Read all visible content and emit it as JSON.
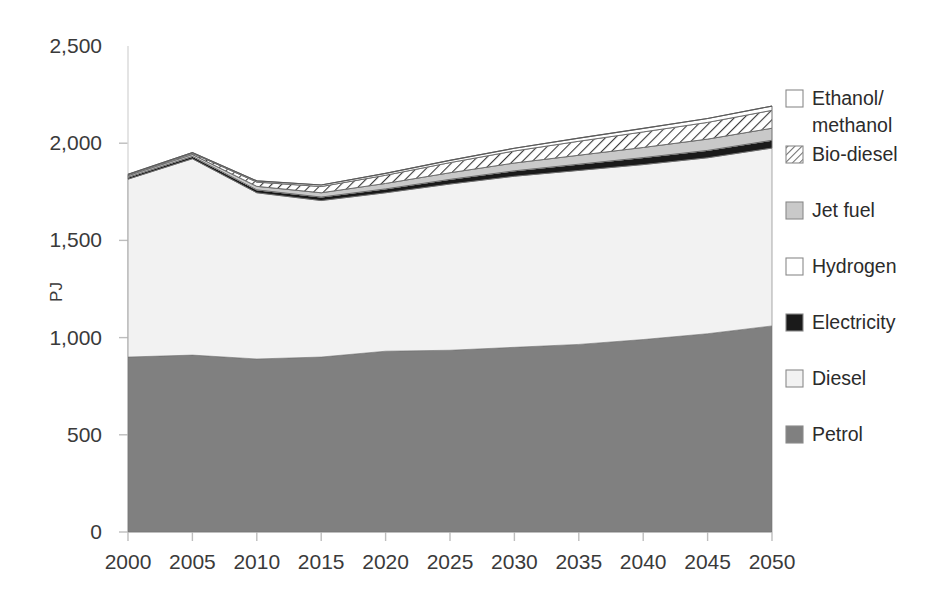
{
  "chart_data": {
    "type": "area",
    "title": "",
    "xlabel": "",
    "ylabel": "PJ",
    "x": [
      2000,
      2005,
      2010,
      2015,
      2020,
      2025,
      2030,
      2035,
      2040,
      2045,
      2050
    ],
    "xtick_labels": [
      "2000",
      "2005",
      "2010",
      "2015",
      "2020",
      "2025",
      "2030",
      "2035",
      "2040",
      "2045",
      "2050"
    ],
    "ytick_labels": [
      "0",
      "500",
      "1,000",
      "1,500",
      "2,000",
      "2,500"
    ],
    "yticks": [
      0,
      500,
      1000,
      1500,
      2000,
      2500
    ],
    "ylim": [
      0,
      2500
    ],
    "xlim": [
      2000,
      2050
    ],
    "grid": false,
    "stacked": true,
    "legend_position": "right",
    "stack_order_bottom_to_top": [
      "Petrol",
      "Diesel",
      "Electricity",
      "Hydrogen",
      "Jet fuel",
      "Bio-diesel",
      "Ethanol/methanol"
    ],
    "series": [
      {
        "name": "Petrol",
        "swatch": "#808080",
        "pattern": "solid",
        "values": [
          900,
          910,
          890,
          900,
          930,
          935,
          950,
          965,
          990,
          1020,
          1060
        ]
      },
      {
        "name": "Diesel",
        "swatch": "#f2f2f2",
        "pattern": "solid",
        "values": [
          915,
          1010,
          855,
          805,
          815,
          855,
          880,
          895,
          900,
          905,
          915
        ]
      },
      {
        "name": "Electricity",
        "swatch": "#1a1a1a",
        "pattern": "solid",
        "values": [
          10,
          12,
          15,
          18,
          20,
          24,
          28,
          32,
          36,
          38,
          40
        ]
      },
      {
        "name": "Hydrogen",
        "swatch": "#ffffff",
        "pattern": "solid",
        "values": [
          0,
          0,
          0,
          0,
          0,
          0,
          0,
          0,
          0,
          0,
          0
        ]
      },
      {
        "name": "Jet fuel",
        "swatch": "#c9c9c9",
        "pattern": "solid",
        "values": [
          8,
          10,
          18,
          22,
          28,
          34,
          40,
          46,
          52,
          58,
          62
        ]
      },
      {
        "name": "Bio-diesel",
        "swatch": "#ffffff",
        "pattern": "hatch",
        "values": [
          4,
          6,
          22,
          32,
          42,
          52,
          62,
          72,
          80,
          86,
          92
        ]
      },
      {
        "name": "Ethanol/methanol",
        "swatch": "#ffffff",
        "pattern": "outline",
        "values": [
          3,
          4,
          6,
          8,
          10,
          12,
          14,
          16,
          18,
          20,
          22
        ]
      }
    ],
    "totals": [
      1840,
      1952,
      1806,
      1785,
      1845,
      1912,
      1974,
      2026,
      2076,
      2127,
      2191
    ]
  },
  "legend": {
    "items": [
      {
        "label": "Ethanol/\nmethanol",
        "label_line1": "Ethanol/",
        "label_line2": "methanol",
        "swatch": "#ffffff",
        "pattern": "outline"
      },
      {
        "label": "Bio-diesel",
        "swatch": "#ffffff",
        "pattern": "hatch"
      },
      {
        "label": "Jet fuel",
        "swatch": "#c9c9c9",
        "pattern": "solid"
      },
      {
        "label": "Hydrogen",
        "swatch": "#ffffff",
        "pattern": "solid"
      },
      {
        "label": "Electricity",
        "swatch": "#1a1a1a",
        "pattern": "solid"
      },
      {
        "label": "Diesel",
        "swatch": "#f2f2f2",
        "pattern": "solid"
      },
      {
        "label": "Petrol",
        "swatch": "#808080",
        "pattern": "solid"
      }
    ]
  },
  "axes": {
    "y_title": "PJ"
  }
}
